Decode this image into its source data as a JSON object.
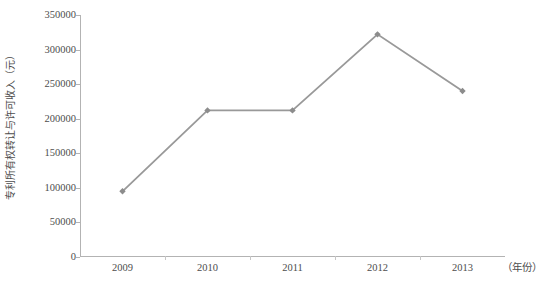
{
  "chart_data": {
    "type": "line",
    "title": "",
    "xlabel": "（年份）",
    "ylabel": "专利所有权转让与许可收入（元）",
    "categories": [
      "2009",
      "2010",
      "2011",
      "2012",
      "2013"
    ],
    "values": [
      95000,
      212000,
      212000,
      322000,
      240000
    ],
    "series": [
      {
        "name": "专利所有权转让与许可收入",
        "values": [
          95000,
          212000,
          212000,
          322000,
          240000
        ]
      }
    ],
    "ylim": [
      0,
      350000
    ],
    "ytick_labels": [
      "0",
      "50000",
      "100000",
      "150000",
      "200000",
      "250000",
      "300000",
      "350000"
    ],
    "ytick_values": [
      0,
      50000,
      100000,
      150000,
      200000,
      250000,
      300000,
      350000
    ],
    "grid": false,
    "legend": "none",
    "line_color": "#999999",
    "marker": "diamond",
    "marker_color": "#8c8c8c",
    "axis_color": "#b3b3b3"
  },
  "axes": {
    "y_title": "专利所有权转让与许可收入（元）",
    "x_unit": "（年份）"
  }
}
